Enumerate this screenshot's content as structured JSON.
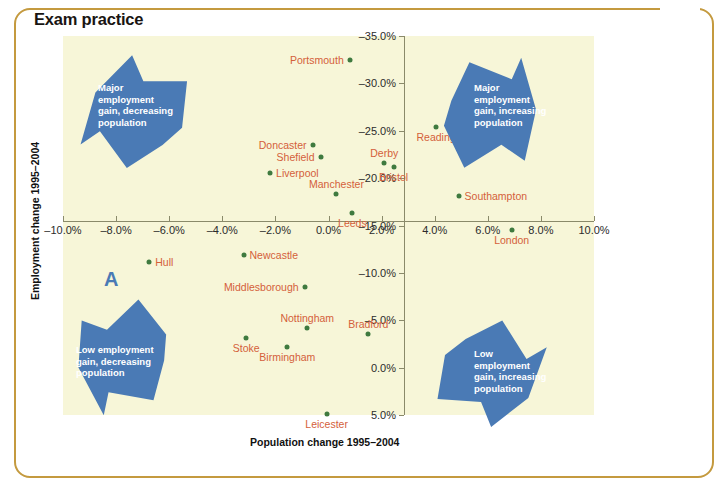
{
  "page": {
    "title": "Exam practice",
    "frame_color": "#c49a3f",
    "plot_bg": "#f7f6d8",
    "point_color": "#3f7a3f",
    "label_color": "#d4603a",
    "arrow_color": "#4a7ab5"
  },
  "chart_data": {
    "type": "scatter",
    "title": "",
    "xlabel": "Population change 1995–2004",
    "ylabel": "Employment change 1995–2004",
    "xlim": [
      -10.0,
      10.0
    ],
    "ylim": [
      -35.0,
      5.0
    ],
    "yaxis_inverted": true,
    "grid": false,
    "legend": "none",
    "xticks": [
      "–10.0%",
      "–8.0%",
      "–6.0%",
      "–4.0%",
      "–2.0%",
      "0.0%",
      "2.0%",
      "4.0%",
      "6.0%",
      "8.0%",
      "10.0%"
    ],
    "xtick_values": [
      -10.0,
      -8.0,
      -6.0,
      -4.0,
      -2.0,
      0.0,
      2.0,
      4.0,
      6.0,
      8.0,
      10.0
    ],
    "yticks": [
      "–35.0%",
      "–30.0%",
      "–25.0%",
      "–20.0%",
      "–15.0%",
      "–10.0%",
      "–5.0%",
      "0.0%",
      "5.0%"
    ],
    "ytick_values": [
      -35.0,
      -30.0,
      -25.0,
      -20.0,
      -15.0,
      -10.0,
      -5.0,
      0.0,
      5.0
    ],
    "points": [
      {
        "label": "Portsmouth",
        "x": 0.8,
        "y": -32.5,
        "pos": "left"
      },
      {
        "label": "Doncaster",
        "x": -0.6,
        "y": -23.5,
        "pos": "left"
      },
      {
        "label": "Shefield",
        "x": -0.3,
        "y": -22.2,
        "pos": "left"
      },
      {
        "label": "Liverpool",
        "x": -2.2,
        "y": -20.5,
        "pos": "right"
      },
      {
        "label": "Manchester",
        "x": 0.3,
        "y": -18.3,
        "pos": "above"
      },
      {
        "label": "Leeds",
        "x": 0.9,
        "y": -16.3,
        "pos": "below"
      },
      {
        "label": "Derby",
        "x": 2.1,
        "y": -21.6,
        "pos": "above"
      },
      {
        "label": "Bristol",
        "x": 2.45,
        "y": -21.2,
        "pos": "below"
      },
      {
        "label": "Reading",
        "x": 4.05,
        "y": -25.4,
        "pos": "below"
      },
      {
        "label": "Southampton",
        "x": 4.9,
        "y": -18.1,
        "pos": "right"
      },
      {
        "label": "London",
        "x": 6.9,
        "y": -14.5,
        "pos": "below"
      },
      {
        "label": "Hull",
        "x": -6.75,
        "y": -11.2,
        "pos": "right"
      },
      {
        "label": "Newcastle",
        "x": -3.2,
        "y": -11.9,
        "pos": "right"
      },
      {
        "label": "Middlesborough",
        "x": -0.9,
        "y": -8.5,
        "pos": "left"
      },
      {
        "label": "Nottingham",
        "x": -0.8,
        "y": -4.2,
        "pos": "above"
      },
      {
        "label": "Stoke",
        "x": -3.1,
        "y": -3.1,
        "pos": "below"
      },
      {
        "label": "Birmingham",
        "x": -1.55,
        "y": -2.2,
        "pos": "below"
      },
      {
        "label": "Bradford",
        "x": 1.5,
        "y": -3.6,
        "pos": "above"
      },
      {
        "label": "Leicester",
        "x": -0.07,
        "y": 4.9,
        "pos": "below"
      }
    ],
    "annotations": [
      {
        "name": "quadrant-top-left",
        "text": "Major\nemployment\ngain, decreasing\npopulation"
      },
      {
        "name": "quadrant-top-right",
        "text": "Major\nemployment\ngain, increasing\npopulation"
      },
      {
        "name": "quadrant-bottom-left",
        "text": "Low employment\ngain, decreasing\npopulation"
      },
      {
        "name": "quadrant-bottom-right",
        "text": "Low\nemployment\ngain, increasing\npopulation"
      },
      {
        "name": "figure-marker",
        "text": "A"
      }
    ]
  }
}
